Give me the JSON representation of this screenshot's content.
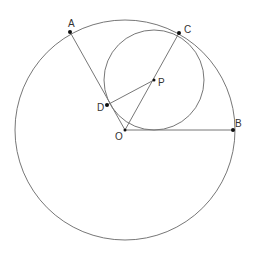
{
  "diagram": {
    "labels": {
      "A": "A",
      "B": "B",
      "C": "C",
      "D": "D",
      "O": "O",
      "P": "P"
    },
    "points": {
      "A": [
        70,
        32
      ],
      "B": [
        233,
        130
      ],
      "C": [
        179,
        33
      ],
      "D": [
        107,
        105
      ],
      "O": [
        125,
        130
      ],
      "P": [
        154,
        80
      ]
    },
    "big_circle": {
      "center": "O",
      "radius": 110
    },
    "small_circle": {
      "center": "P",
      "radius": 50
    },
    "segments": [
      [
        "O",
        "A"
      ],
      [
        "O",
        "B"
      ],
      [
        "O",
        "C"
      ],
      [
        "P",
        "D"
      ]
    ],
    "stroke_color": "#777777",
    "point_color": "#111111"
  }
}
